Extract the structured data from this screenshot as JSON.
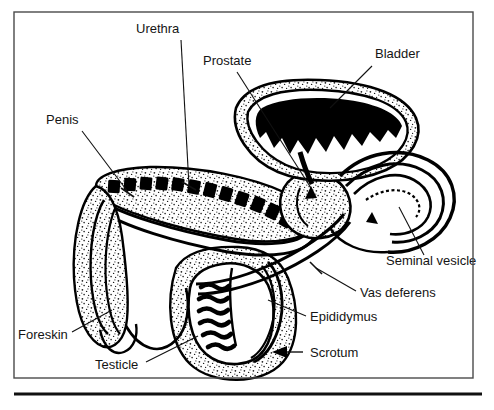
{
  "figure": {
    "style": {
      "ink": "#000000",
      "paper": "#ffffff",
      "frame_stroke": "#4a4a4a",
      "rule_stroke": "#111111",
      "label_color": "#151515",
      "stipple_color": "#1a1a1a"
    },
    "frame": {
      "x": 14,
      "y": 12,
      "width": 459,
      "height": 366
    },
    "bottom_rule": {
      "x1": 14,
      "y1": 394,
      "x2": 482,
      "y2": 394
    }
  },
  "labels": [
    {
      "id": "urethra",
      "text": "Urethra",
      "x": 136,
      "y": 33,
      "anchor": "start",
      "leader": {
        "type": "line-tick",
        "x1": 181,
        "y1": 40,
        "x2": 189,
        "y2": 186
      }
    },
    {
      "id": "penis",
      "text": "Penis",
      "x": 46,
      "y": 124,
      "anchor": "start",
      "leader": {
        "type": "line-tick",
        "x1": 82,
        "y1": 131,
        "x2": 128,
        "y2": 192
      }
    },
    {
      "id": "prostate",
      "text": "Prostate",
      "x": 203,
      "y": 65,
      "anchor": "start",
      "leader": {
        "type": "line-arrow",
        "x1": 237,
        "y1": 72,
        "x2": 311,
        "y2": 186
      }
    },
    {
      "id": "bladder",
      "text": "Bladder",
      "x": 375,
      "y": 58,
      "anchor": "start",
      "leader": {
        "type": "line-arrow",
        "x1": 372,
        "y1": 66,
        "x2": 326,
        "y2": 111
      }
    },
    {
      "id": "foreskin",
      "text": "Foreskin",
      "x": 18,
      "y": 339,
      "anchor": "start",
      "leader": {
        "type": "line-plain",
        "x1": 72,
        "y1": 332,
        "x2": 110,
        "y2": 311
      }
    },
    {
      "id": "testicle",
      "text": "Testicle",
      "x": 95,
      "y": 369,
      "anchor": "start",
      "leader": {
        "type": "line-plain",
        "x1": 146,
        "y1": 362,
        "x2": 196,
        "y2": 338
      }
    },
    {
      "id": "seminal-vesicle",
      "text": "Seminal vesicle",
      "x": 386,
      "y": 265,
      "anchor": "start",
      "leader": {
        "type": "line-plain",
        "x1": 424,
        "y1": 255,
        "x2": 399,
        "y2": 207
      }
    },
    {
      "id": "vas-deferens",
      "text": "Vas deferens",
      "x": 360,
      "y": 297,
      "anchor": "start",
      "leader": {
        "type": "line-tick",
        "x1": 356,
        "y1": 291,
        "x2": 316,
        "y2": 268
      }
    },
    {
      "id": "epididymus",
      "text": "Epididymus",
      "x": 310,
      "y": 321,
      "anchor": "start",
      "leader": {
        "type": "line-plain",
        "x1": 306,
        "y1": 316,
        "x2": 268,
        "y2": 300
      }
    },
    {
      "id": "scrotum",
      "text": "Scrotum",
      "x": 310,
      "y": 357,
      "anchor": "start",
      "leader": {
        "type": "arrow-left",
        "x1": 303,
        "y1": 352,
        "x2": 277,
        "y2": 352
      }
    }
  ],
  "structures": [
    {
      "id": "bladder-lumen",
      "label": "Bladder lumen",
      "fill": "solid-black"
    },
    {
      "id": "bladder-wall",
      "label": "Bladder wall",
      "fill": "white-outline"
    },
    {
      "id": "prostate-body",
      "label": "Prostate",
      "fill": "stippled"
    },
    {
      "id": "penis-shaft",
      "label": "Penis shaft",
      "fill": "segmented"
    },
    {
      "id": "corpus-segments",
      "label": "Corpus cavernosum segments",
      "fill": "solid-black"
    },
    {
      "id": "urethra-tube",
      "label": "Urethra tube",
      "fill": "white-outline"
    },
    {
      "id": "glans-foreskin",
      "label": "Glans and foreskin",
      "fill": "stippled"
    },
    {
      "id": "testicle-body",
      "label": "Testicle",
      "fill": "banded"
    },
    {
      "id": "seminiferous-bands",
      "label": "Seminiferous tubules",
      "fill": "solid-black"
    },
    {
      "id": "epididymis-coil",
      "label": "Epididymis",
      "fill": "white-outline"
    },
    {
      "id": "scrotum-sac",
      "label": "Scrotum",
      "fill": "stippled"
    },
    {
      "id": "vas-deferens-duct",
      "label": "Vas deferens",
      "fill": "white-outline"
    },
    {
      "id": "seminal-vesicle-coil",
      "label": "Seminal vesicle",
      "fill": "white-outline"
    }
  ]
}
